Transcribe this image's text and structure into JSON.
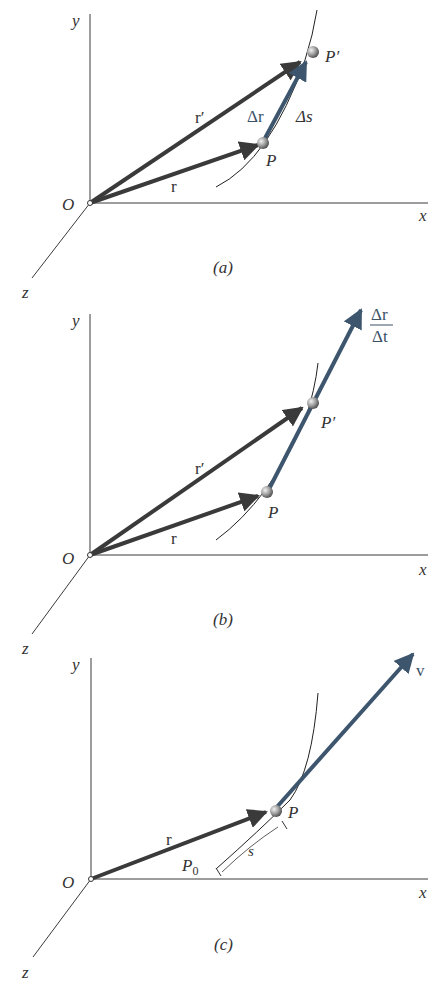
{
  "colors": {
    "axis": "#3a3a3a",
    "position_vector": "#3a3a3a",
    "blue_vector": "#3d566e",
    "path": "#222222",
    "particle": "#9a9a9a"
  },
  "panels": [
    {
      "caption": "(a)",
      "axes": {
        "x": "x",
        "y": "y",
        "z": "z",
        "origin": "O"
      },
      "labels": {
        "r": "r",
        "r_prime": "r′",
        "delta_r": "Δr",
        "delta_s": "Δs",
        "P": "P",
        "P_prime": "P′"
      }
    },
    {
      "caption": "(b)",
      "axes": {
        "x": "x",
        "y": "y",
        "z": "z",
        "origin": "O"
      },
      "labels": {
        "r": "r",
        "r_prime": "r′",
        "P": "P",
        "P_prime": "P′",
        "frac_num": "Δr",
        "frac_den": "Δt"
      }
    },
    {
      "caption": "(c)",
      "axes": {
        "x": "x",
        "y": "y",
        "z": "z",
        "origin": "O"
      },
      "labels": {
        "r": "r",
        "v": "v",
        "P": "P",
        "P0": "P",
        "P0_sub": "0",
        "s": "s"
      }
    }
  ]
}
